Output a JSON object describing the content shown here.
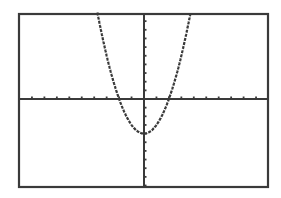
{
  "screen": {
    "background": "#ffffff",
    "ink": "#3a3a3a",
    "frame": {
      "left": 19,
      "top": 14,
      "right": 268,
      "bottom": 187
    }
  },
  "chart_data": {
    "type": "line",
    "title": "",
    "xlabel": "",
    "ylabel": "",
    "function": "y = x^2 - 4",
    "xlim": [
      -10,
      10
    ],
    "ylim": [
      -10,
      10
    ],
    "xscl": 1,
    "yscl": 1,
    "grid": false,
    "legend": null,
    "axes_origin_px": {
      "x": 144,
      "y": 99
    },
    "vertex": {
      "x": 0,
      "y": -4
    },
    "x_intercepts": [
      -2,
      2
    ],
    "series": [
      {
        "name": "Y1",
        "x": [
          -3.74,
          -3,
          -2,
          -1,
          0,
          1,
          2,
          3,
          3.74
        ],
        "values": [
          10,
          5,
          0,
          -3,
          -4,
          -3,
          0,
          5,
          10
        ]
      }
    ]
  }
}
